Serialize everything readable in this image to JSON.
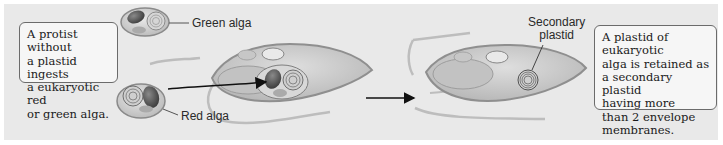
{
  "diagram": {
    "style": "grayscale",
    "steps": [
      {
        "id": "step-1",
        "caption": "A protist without\na plastid ingests\na eukaryotic red\nor green alga."
      },
      {
        "id": "step-2",
        "caption": "A plastid of eukaryotic\nalga is retained as\na secondary plastid\nhaving more\nthan 2 envelope\nmembranes."
      }
    ],
    "labels": {
      "green_alga": "Green alga",
      "red_alga": "Red alga",
      "secondary_plastid": "Secondary\nplastid"
    },
    "arrows": [
      {
        "from": "red-alga",
        "to": "protist-cell-engulfing",
        "label": ""
      },
      {
        "from": "protist-cell-engulfing",
        "to": "protist-cell-with-secondary-plastid",
        "label": ""
      }
    ],
    "colors": {
      "background": "#e9e9e9",
      "cell_fill": "#cfcfcf",
      "cell_outline": "#8a8a8a",
      "text": "#1a1a1a"
    }
  }
}
